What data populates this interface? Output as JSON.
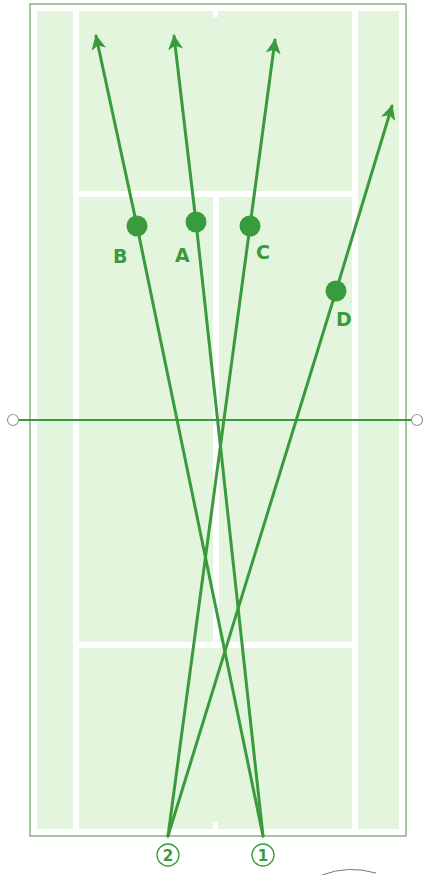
{
  "diagram": {
    "colors": {
      "court_fill": "#e3f5dc",
      "court_lines": "#ffffff",
      "court_border": "#9bbf95",
      "shot_line": "#3a9a3e",
      "net_end": "#9a9a9a"
    },
    "court": {
      "outer": {
        "x": 30,
        "y": 4,
        "w": 376,
        "h": 832
      },
      "singles_left_x": 76,
      "singles_right_x": 355,
      "service_line_top_y": 194,
      "service_line_bottom_y": 645,
      "center_x": 216,
      "net_y": 420
    },
    "players": [
      {
        "id": "1",
        "label": "①",
        "text": "1",
        "x": 263,
        "y": 836
      },
      {
        "id": "2",
        "label": "②",
        "text": "2",
        "x": 168,
        "y": 836
      }
    ],
    "targets": [
      {
        "id": "A",
        "label": "A",
        "from": "1",
        "dot": [
          196,
          222
        ],
        "tip": [
          174,
          33
        ],
        "label_pos": [
          175,
          262
        ]
      },
      {
        "id": "B",
        "label": "B",
        "from": "1",
        "dot": [
          137,
          226
        ],
        "tip": [
          96,
          33
        ],
        "label_pos": [
          113,
          262
        ]
      },
      {
        "id": "C",
        "label": "C",
        "from": "2",
        "dot": [
          250,
          226
        ],
        "tip": [
          275,
          37
        ],
        "label_pos": [
          256,
          258
        ]
      },
      {
        "id": "D",
        "label": "D",
        "from": "2",
        "dot": [
          336,
          291
        ],
        "tip": [
          393,
          103
        ],
        "label_pos": [
          336,
          326
        ]
      }
    ],
    "labels": {
      "A": "A",
      "B": "B",
      "C": "C",
      "D": "D",
      "p1": "1",
      "p2": "2"
    }
  }
}
